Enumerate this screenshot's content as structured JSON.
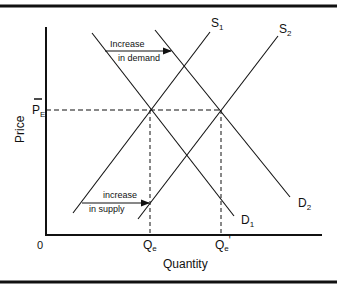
{
  "diagram": {
    "type": "supply-demand",
    "axes": {
      "y_label": "Price",
      "x_label": "Quantity",
      "origin_label": "0",
      "price_equilibrium_label": "P",
      "price_equilibrium_sub": "E"
    },
    "quantity_labels": {
      "qe": "Q",
      "qe_sub": "e",
      "qe2": "Q",
      "qe2_sub": "e",
      "qe2_prime": "'"
    },
    "curves": {
      "s1": {
        "label": "S",
        "sub": "1"
      },
      "s2": {
        "label": "S",
        "sub": "2"
      },
      "d1": {
        "label": "D",
        "sub": "1"
      },
      "d2": {
        "label": "D",
        "sub": "2"
      }
    },
    "annotations": {
      "demand_line1": "Increase",
      "demand_line2": "in demand",
      "supply_line1": "increase",
      "supply_line2": "in supply"
    },
    "colors": {
      "ink": "#111111",
      "background": "#ffffff"
    }
  }
}
